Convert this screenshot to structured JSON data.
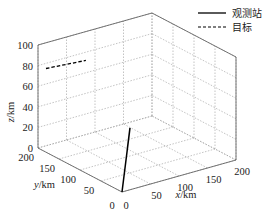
{
  "chart_data": {
    "type": "line3d",
    "title": "",
    "xlabel": "x/km",
    "ylabel": "y/km",
    "zlabel": "z/km",
    "xlim": [
      0,
      200
    ],
    "ylim": [
      0,
      200
    ],
    "zlim": [
      0,
      100
    ],
    "x_ticks": [
      "0",
      "50",
      "100",
      "150",
      "200"
    ],
    "y_ticks": [
      "0",
      "50",
      "100",
      "150",
      "200"
    ],
    "z_ticks": [
      "0",
      "20",
      "40",
      "60",
      "80",
      "100"
    ],
    "grid": true,
    "legend_position": "top-right",
    "series": [
      {
        "name": "观测站",
        "style": "solid",
        "color": "#000000",
        "points": [
          [
            0,
            0,
            0
          ],
          [
            14,
            0,
            60
          ]
        ]
      },
      {
        "name": "目标",
        "style": "dashed",
        "color": "#000000",
        "points": [
          [
            14,
            200,
            75
          ],
          [
            84,
            200,
            72
          ]
        ]
      }
    ]
  },
  "legend": {
    "items": [
      {
        "label": "观测站",
        "style": "solid"
      },
      {
        "label": "目标",
        "style": "dashed"
      }
    ]
  },
  "axes": {
    "x": {
      "label_main": "x",
      "label_unit": "/km"
    },
    "y": {
      "label_main": "y",
      "label_unit": "/km"
    },
    "z": {
      "label_main": "z",
      "label_unit": "/km"
    }
  }
}
